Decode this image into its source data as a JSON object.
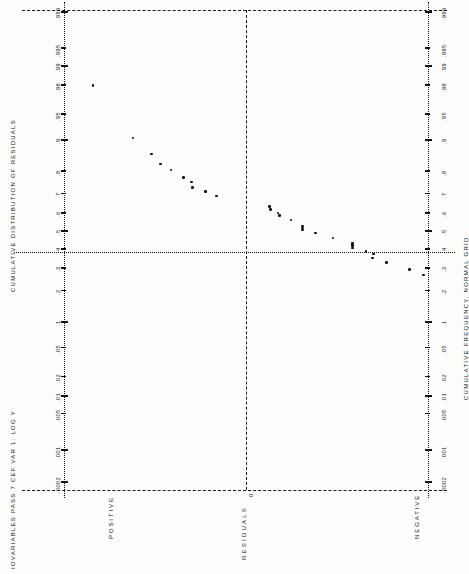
{
  "chart_data": {
    "type": "scatter",
    "title": "IOVARIABLES PASS 7 CEF VAR 1: LOG Y",
    "subtitle": "CUMULATIVE DISTRIBUTION OF RESIDUALS",
    "axis_title_right": "CUMULATIVE FREQUENCY, NORMAL GRID",
    "orientation": "rotated-90",
    "xlabel": "RESIDUALS",
    "ylabel": "CUMULATIVE FREQUENCY, NORMAL GRID",
    "grid": true,
    "legend": "none",
    "prob_axis_ticks": [
      ".0002",
      ".001",
      ".005",
      ".01",
      ".02",
      ".05",
      ".1",
      ".2",
      ".3",
      ".4",
      ".5",
      ".6",
      ".7",
      ".8",
      ".9",
      ".95",
      ".98",
      ".99",
      ".995",
      ".999"
    ],
    "prob_axis_values": [
      0.0002,
      0.001,
      0.005,
      0.01,
      0.02,
      0.05,
      0.1,
      0.2,
      0.3,
      0.4,
      0.5,
      0.6,
      0.7,
      0.8,
      0.9,
      0.95,
      0.98,
      0.99,
      0.995,
      0.999
    ],
    "residual_axis_labels": [
      "POSITIVE",
      "0",
      "NEGATIVE"
    ],
    "residual_zero_label": "0",
    "xlim_note": "residual axis: positive at left, zero at center, negative at right",
    "points": [
      {
        "cum_freq": 0.98,
        "residual_pos": 0.158
      },
      {
        "cum_freq": 0.905,
        "residual_pos": 0.255
      },
      {
        "cum_freq": 0.862,
        "residual_pos": 0.3
      },
      {
        "cum_freq": 0.828,
        "residual_pos": 0.323
      },
      {
        "cum_freq": 0.805,
        "residual_pos": 0.348
      },
      {
        "cum_freq": 0.775,
        "residual_pos": 0.378
      },
      {
        "cum_freq": 0.755,
        "residual_pos": 0.398
      },
      {
        "cum_freq": 0.73,
        "residual_pos": 0.4
      },
      {
        "cum_freq": 0.712,
        "residual_pos": 0.432
      },
      {
        "cum_freq": 0.69,
        "residual_pos": 0.458
      },
      {
        "cum_freq": 0.635,
        "residual_pos": 0.588
      },
      {
        "cum_freq": 0.62,
        "residual_pos": 0.59
      },
      {
        "cum_freq": 0.6,
        "residual_pos": 0.608
      },
      {
        "cum_freq": 0.588,
        "residual_pos": 0.612
      },
      {
        "cum_freq": 0.562,
        "residual_pos": 0.64
      },
      {
        "cum_freq": 0.528,
        "residual_pos": 0.668
      },
      {
        "cum_freq": 0.518,
        "residual_pos": 0.668
      },
      {
        "cum_freq": 0.505,
        "residual_pos": 0.668
      },
      {
        "cum_freq": 0.49,
        "residual_pos": 0.7
      },
      {
        "cum_freq": 0.462,
        "residual_pos": 0.742
      },
      {
        "cum_freq": 0.43,
        "residual_pos": 0.79
      },
      {
        "cum_freq": 0.418,
        "residual_pos": 0.79
      },
      {
        "cum_freq": 0.405,
        "residual_pos": 0.79
      },
      {
        "cum_freq": 0.388,
        "residual_pos": 0.822
      },
      {
        "cum_freq": 0.372,
        "residual_pos": 0.84
      },
      {
        "cum_freq": 0.352,
        "residual_pos": 0.838
      },
      {
        "cum_freq": 0.33,
        "residual_pos": 0.872
      },
      {
        "cum_freq": 0.295,
        "residual_pos": 0.928
      },
      {
        "cum_freq": 0.268,
        "residual_pos": 0.962
      }
    ]
  },
  "labels": {
    "title_line": "IOVARIABLES PASS 7 CEF VAR 1: LOG Y",
    "left_axis_title": "CUMULATIVE DISTRIBUTION OF RESIDUALS",
    "right_axis_title": "CUMULATIVE FREQUENCY, NORMAL GRID",
    "positive": "POSITIVE",
    "negative": "NEGATIVE",
    "zero": "0",
    "bottom_label": "RESIDUALS"
  },
  "ticks": {
    "t0": ".0002",
    "t1": ".001",
    "t2": ".005",
    "t3": ".01",
    "t4": ".02",
    "t5": ".05",
    "t6": ".1",
    "t7": ".2",
    "t8": ".3",
    "t9": ".4",
    "t10": ".5",
    "t11": ".6",
    "t12": ".7",
    "t13": ".8",
    "t14": ".9",
    "t15": ".95",
    "t16": ".98",
    "t17": ".99",
    "t18": ".995",
    "t19": ".999"
  },
  "colors": {
    "ink": "#111111",
    "paper": "#fdfdfb"
  }
}
